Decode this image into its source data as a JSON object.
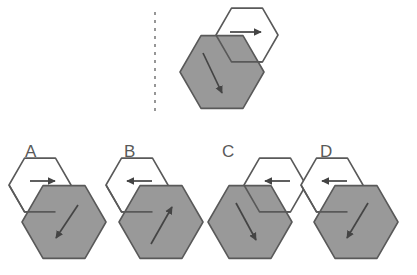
{
  "figure": {
    "background_color": "#ffffff",
    "stroke_color": "#595959",
    "gray_fill": "#999999",
    "white_fill": "#ffffff",
    "stroke_width": 1.6,
    "label_color": "#595959",
    "label_font_size": 17
  },
  "divider": {
    "name": "vertical-dashed-divider",
    "x": 155,
    "y_start": 12,
    "y_end": 112,
    "dash": "3 5",
    "color": "#7d7d7d",
    "width": 1.6
  },
  "prompt": {
    "name": "reference-figure",
    "caption": "",
    "gray_hexagon": {
      "center_x": 222,
      "center_y": 72,
      "radius": 42,
      "fill": "#999999",
      "arrow_direction": "down-right",
      "arrow_from_x": 203,
      "arrow_from_y": 53,
      "arrow_to_x": 222,
      "arrow_to_y": 93
    },
    "white_hexagon": {
      "center_x": 247,
      "center_y": 35,
      "radius": 31,
      "fill": "#ffffff",
      "arrow_direction": "right",
      "arrow_from_x": 230,
      "arrow_from_y": 32,
      "arrow_to_x": 261,
      "arrow_to_y": 32
    },
    "white_hexagon_position": "upper-right"
  },
  "options": [
    {
      "label": "A",
      "name": "option-a",
      "label_x": 25,
      "label_y": 143,
      "gray_hexagon": {
        "center_x": 64,
        "center_y": 222,
        "radius": 42,
        "fill": "#999999",
        "arrow_direction": "down-left",
        "arrow_from_x": 78,
        "arrow_from_y": 205,
        "arrow_to_x": 56,
        "arrow_to_y": 238
      },
      "white_hexagon": {
        "center_x": 40,
        "center_y": 185,
        "radius": 31,
        "fill": "#ffffff",
        "arrow_direction": "right",
        "arrow_from_x": 30,
        "arrow_from_y": 181,
        "arrow_to_x": 55,
        "arrow_to_y": 181
      },
      "white_hexagon_position": "upper-left"
    },
    {
      "label": "B",
      "name": "option-b",
      "label_x": 124,
      "label_y": 143,
      "gray_hexagon": {
        "center_x": 161,
        "center_y": 222,
        "radius": 42,
        "fill": "#999999",
        "arrow_direction": "up-right",
        "arrow_from_x": 151,
        "arrow_from_y": 244,
        "arrow_to_x": 172,
        "arrow_to_y": 207
      },
      "white_hexagon": {
        "center_x": 137,
        "center_y": 185,
        "radius": 31,
        "fill": "#ffffff",
        "arrow_direction": "left",
        "arrow_from_x": 152,
        "arrow_from_y": 181,
        "arrow_to_x": 127,
        "arrow_to_y": 181
      },
      "white_hexagon_position": "upper-left"
    },
    {
      "label": "C",
      "name": "option-c",
      "label_x": 222,
      "label_y": 143,
      "gray_hexagon": {
        "center_x": 250,
        "center_y": 222,
        "radius": 42,
        "fill": "#999999",
        "arrow_direction": "down-right",
        "arrow_from_x": 236,
        "arrow_from_y": 203,
        "arrow_to_x": 256,
        "arrow_to_y": 240
      },
      "white_hexagon": {
        "center_x": 275,
        "center_y": 185,
        "radius": 31,
        "fill": "#ffffff",
        "arrow_direction": "left",
        "arrow_from_x": 290,
        "arrow_from_y": 181,
        "arrow_to_x": 265,
        "arrow_to_y": 181
      },
      "white_hexagon_position": "upper-right"
    },
    {
      "label": "D",
      "name": "option-d",
      "label_x": 320,
      "label_y": 143,
      "gray_hexagon": {
        "center_x": 356,
        "center_y": 222,
        "radius": 42,
        "fill": "#999999",
        "arrow_direction": "down-left",
        "arrow_from_x": 368,
        "arrow_from_y": 203,
        "arrow_to_x": 347,
        "arrow_to_y": 238
      },
      "white_hexagon": {
        "center_x": 332,
        "center_y": 185,
        "radius": 31,
        "fill": "#ffffff",
        "arrow_direction": "left",
        "arrow_from_x": 347,
        "arrow_from_y": 181,
        "arrow_to_x": 322,
        "arrow_to_y": 181
      },
      "white_hexagon_position": "upper-left"
    }
  ]
}
